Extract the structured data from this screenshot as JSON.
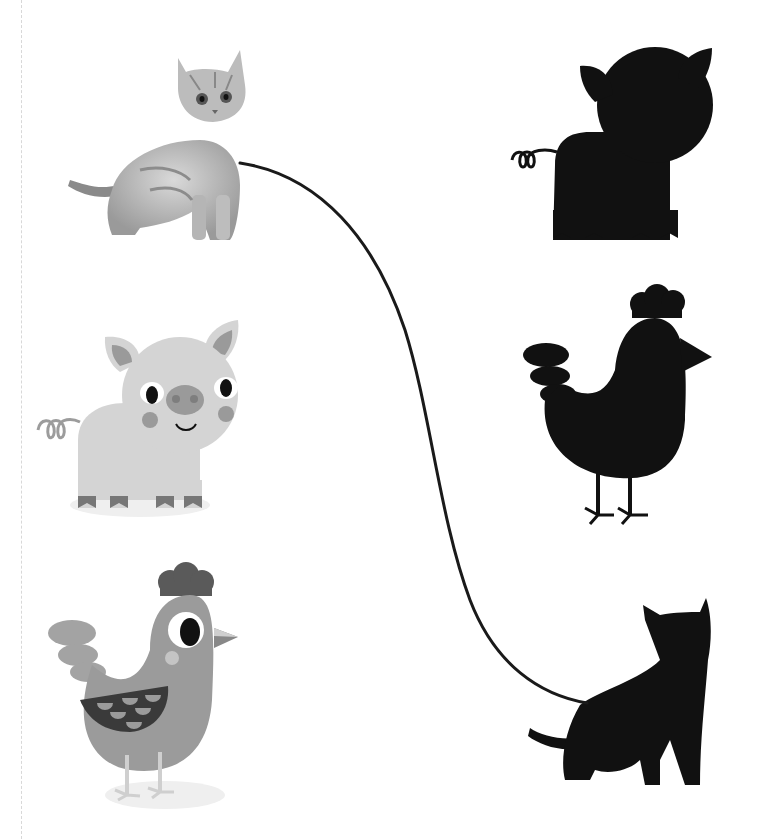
{
  "worksheet": {
    "activity": "match-animal-to-silhouette",
    "left_column": [
      {
        "id": "kitten-photo",
        "label": "kitten",
        "style": "grayscale photo"
      },
      {
        "id": "pig-cartoon",
        "label": "pig",
        "style": "grayscale cartoon"
      },
      {
        "id": "hen-cartoon",
        "label": "hen",
        "style": "grayscale cartoon"
      }
    ],
    "right_column": [
      {
        "id": "pig-silhouette",
        "label": "pig silhouette"
      },
      {
        "id": "hen-silhouette",
        "label": "hen silhouette"
      },
      {
        "id": "cat-silhouette",
        "label": "cat silhouette"
      }
    ],
    "connections": [
      {
        "from": "kitten-photo",
        "to": "cat-silhouette"
      }
    ],
    "colors": {
      "silhouette": "#111111",
      "line": "#1a1a1a",
      "pig_body": "#d6d6d6",
      "pig_accent": "#9a9a9a",
      "hen_body": "#9b9b9b",
      "hen_comb": "#5a5a5a",
      "hen_wing": "#3a3a3a",
      "guide": "#d8d8d8"
    }
  }
}
